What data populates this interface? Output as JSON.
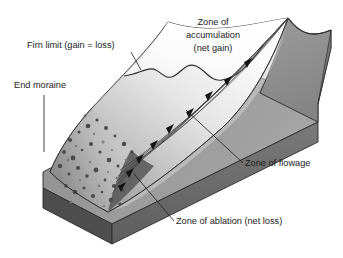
{
  "figure": {
    "background_color": "#ffffff",
    "width": 343,
    "height": 258
  },
  "labels": {
    "firn_limit": "Firn limit (gain = loss)",
    "end_moraine": "End moraine",
    "accumulation_line1": "Zone of",
    "accumulation_line2": "accumulation",
    "accumulation_line3": "(net gain)",
    "flowage": "Zone of flowage",
    "ablation": "Zone of ablation (net loss)"
  },
  "colors": {
    "background": "#ffffff",
    "text": "#1b1b1b",
    "outline": "#2b2b2b",
    "valley_wall": "#8f8f8f",
    "valley_wall_dark": "#6f6f6f",
    "bedrock_front": "#6a6a6a",
    "bedrock_top": "#9a9a9a",
    "bedrock_side": "#4e4e4e",
    "snow_white": "#fdfdfd",
    "ice_gray": "#c9c9c9",
    "moraine_debris": "#4a4a4a",
    "flow_line": "#3a3a3a",
    "arrow": "#141414"
  },
  "features": {
    "flow_direction": "down-glacier from accumulation apex toward terminus",
    "arrow_count": 9,
    "flow_line_count": 7
  }
}
